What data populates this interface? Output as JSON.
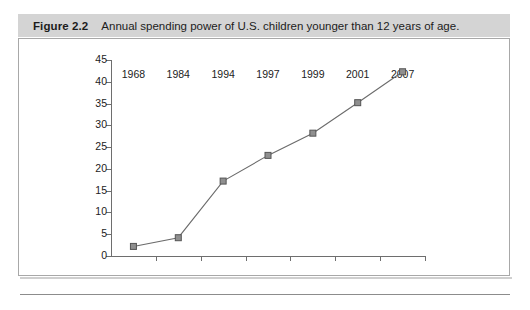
{
  "figure": {
    "label": "Figure 2.2",
    "caption": "Annual spending power of U.S. children younger than 12 years of age."
  },
  "colors": {
    "caption_band": "#d4d4d4",
    "panel_border": "#a8a8a8",
    "axis": "#6e6e6e",
    "line": "#6b6b6b",
    "marker_fill": "#8f8f8f",
    "marker_border": "#555555",
    "text": "#1c1c1c"
  },
  "chart_data": {
    "type": "line",
    "title": "Annual spending power of U.S. children younger than 12 years of age.",
    "categories": [
      "1968",
      "1984",
      "1994",
      "1997",
      "1999",
      "2001",
      "2007"
    ],
    "values": [
      2.2,
      4.2,
      17.2,
      23.1,
      28.2,
      35.2,
      42.3
    ],
    "series": [
      {
        "name": "Annual spending power",
        "values": [
          2.2,
          4.2,
          17.2,
          23.1,
          28.2,
          35.2,
          42.3
        ]
      }
    ],
    "xlabel": "",
    "ylabel": "",
    "ylim": [
      0,
      45
    ],
    "ytick_step": 5,
    "yticks": [
      0,
      5,
      10,
      15,
      20,
      25,
      30,
      35,
      40,
      45
    ],
    "ytick_labels": [
      "0",
      "5",
      "10",
      "15",
      "20",
      "25",
      "30",
      "35",
      "40",
      "45"
    ],
    "grid": false,
    "legend": false,
    "marker": "square"
  }
}
